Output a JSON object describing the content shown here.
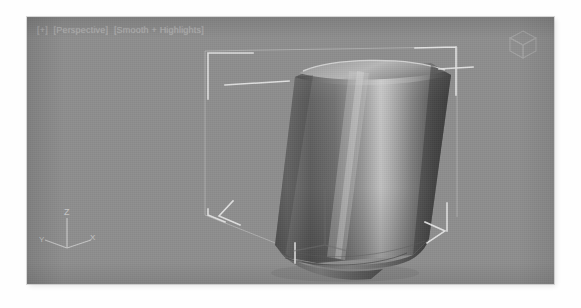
{
  "window": {
    "background_color": "#ffffff"
  },
  "viewport": {
    "name": "perspective-viewport",
    "background_color": "#8e8e8e",
    "label": {
      "toggle": "[+]",
      "view": "[Perspective]",
      "shading": "[Smooth + Highlights]"
    },
    "bounds": {
      "left": 27,
      "top": 17,
      "width": 527,
      "height": 267
    }
  },
  "view_cube": {
    "name": "view-cube",
    "label": "ViewCube"
  },
  "world_axis": {
    "name": "world-axis-tripod",
    "z_label": "Z",
    "y_label": "Y",
    "x_label": "X",
    "color": "#d9d9d9"
  },
  "local_gizmo": {
    "name": "object-pivot-gizmo",
    "z_label": "Z",
    "color": "#7a7a7a"
  },
  "object": {
    "name": "cylinder-mesh",
    "description": "Chamfered cylinder, leaning, smooth-shaded",
    "highlight_color": "#c8c8c8",
    "base_color": "#6f6f6f",
    "shadow_color": "#3a3a3a"
  },
  "selection": {
    "name": "selection-brackets",
    "color": "#e6e6e6",
    "corners": 8
  }
}
